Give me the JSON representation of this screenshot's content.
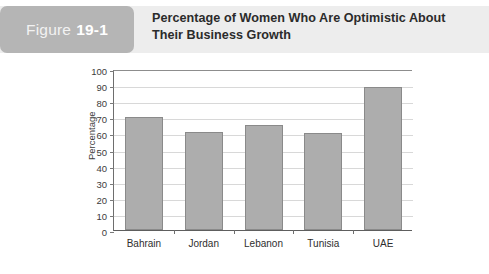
{
  "figure": {
    "badge_word": "Figure",
    "badge_number": "19-1",
    "title": "Percentage of Women Who Are Optimistic About Their Business Growth"
  },
  "colors": {
    "header_band": "#ededed",
    "badge": "#b5b5b5",
    "badge_text": "#ffffff",
    "title_text": "#2b2b2b",
    "bar_fill": "#adadad",
    "bar_border": "#8a8a8a",
    "gridline": "#d8d8d8",
    "axis": "#6e6e6e",
    "plot_background": "#ffffff"
  },
  "chart_data": {
    "type": "bar",
    "title": "Percentage of Women Who Are Optimistic About Their Business Growth",
    "categories": [
      "Bahrain",
      "Jordan",
      "Lebanon",
      "Tunisia",
      "UAE"
    ],
    "values": [
      70,
      61,
      65,
      60,
      89
    ],
    "xlabel": "",
    "ylabel": "Percentage",
    "ylim": [
      0,
      100
    ],
    "ytick_step": 10,
    "yticks": [
      0,
      10,
      20,
      30,
      40,
      50,
      60,
      70,
      80,
      90,
      100
    ],
    "ytick_labels": [
      "0",
      "10",
      "20",
      "30",
      "40",
      "50",
      "60",
      "70",
      "80",
      "90",
      "100"
    ],
    "grid": true,
    "grid_axis": "y",
    "legend": false,
    "legend_position": "none",
    "series": [
      {
        "name": "Percentage",
        "values": [
          70,
          61,
          65,
          60,
          89
        ]
      }
    ]
  }
}
